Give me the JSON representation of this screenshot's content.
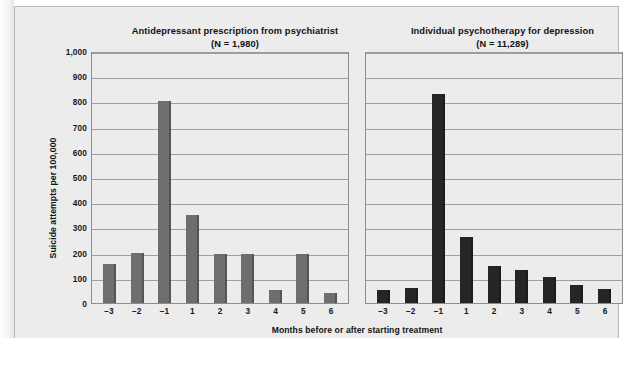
{
  "figure": {
    "x_axis_label": "Months before or after starting treatment",
    "y_axis_label": "Suicide attempts per 100,000"
  },
  "chart_data": {
    "type": "bar",
    "title": "",
    "xlabel": "Months before or after starting treatment",
    "ylabel": "Suicide attempts per 100,000",
    "ylim": [
      0,
      1000
    ],
    "yticks": [
      "0",
      "100",
      "200",
      "300",
      "400",
      "500",
      "600",
      "700",
      "800",
      "900",
      "1,000"
    ],
    "ytick_values": [
      0,
      100,
      200,
      300,
      400,
      500,
      600,
      700,
      800,
      900,
      1000
    ],
    "grid": true,
    "legend": "none",
    "categories": [
      "−3",
      "−2",
      "−1",
      "1",
      "2",
      "3",
      "4",
      "5",
      "6"
    ],
    "panels": [
      {
        "title": "Antidepressant prescription from psychiatrist",
        "subtitle": "(N = 1,980)",
        "n_label": "(N = 1,980)",
        "bar_color": "#6d6e70",
        "values": [
          155,
          200,
          800,
          350,
          195,
          195,
          50,
          195,
          40
        ]
      },
      {
        "title": "Individual psychotherapy for depression",
        "subtitle": "(N = 11,289)",
        "n_label": "(N = 11,289)",
        "bar_color": "#242527",
        "values": [
          50,
          60,
          830,
          260,
          145,
          130,
          105,
          70,
          55
        ]
      }
    ]
  }
}
